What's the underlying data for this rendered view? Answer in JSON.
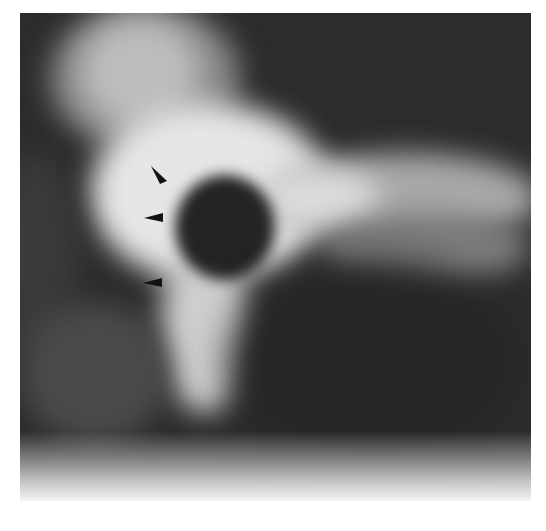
{
  "image": {
    "type": "radiograph",
    "colormap": "grayscale",
    "colors": {
      "background": "#ffffff",
      "dark_field": "#2c2c2c",
      "bright_bone": "#f2f2f2",
      "lucency": "#1f1f1f",
      "arrowhead": "#111111"
    }
  },
  "annotations": {
    "arrowheads": [
      {
        "label": "arrowhead-1",
        "x": 158,
        "y": 174,
        "direction": "down-right"
      },
      {
        "label": "arrowhead-2",
        "x": 155,
        "y": 218,
        "direction": "right"
      },
      {
        "label": "arrowhead-3",
        "x": 152,
        "y": 283,
        "direction": "right"
      }
    ]
  }
}
